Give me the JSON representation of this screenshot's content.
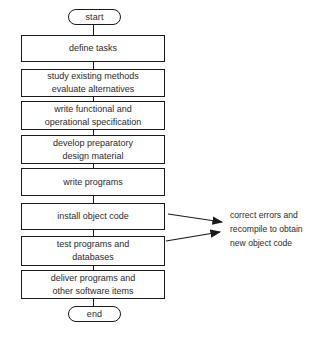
{
  "diagram": {
    "background_color": "#ffffff",
    "stroke_color": "#1a1a1a",
    "text_color": "#2b2b2b",
    "start": {
      "label": "start"
    },
    "end": {
      "label": "end"
    },
    "steps": [
      {
        "id": "define-tasks",
        "lines": [
          "define tasks"
        ]
      },
      {
        "id": "study-existing-methods",
        "lines": [
          "study existing methods",
          "evaluate alternatives"
        ]
      },
      {
        "id": "write-functional-specification",
        "lines": [
          "write functional and",
          "operational specification"
        ]
      },
      {
        "id": "develop-preparatory-design-material",
        "lines": [
          "develop preparatory",
          "design material"
        ]
      },
      {
        "id": "write-programs",
        "lines": [
          "write programs"
        ]
      },
      {
        "id": "install-object-code",
        "lines": [
          "install object code"
        ]
      },
      {
        "id": "test-programs-and-databases",
        "lines": [
          "test programs and",
          "databases"
        ]
      },
      {
        "id": "deliver-programs",
        "lines": [
          "deliver programs and",
          "other software items"
        ]
      }
    ],
    "annotation": {
      "lines": [
        "correct errors and",
        "recompile to obtain",
        "new object code"
      ]
    }
  }
}
